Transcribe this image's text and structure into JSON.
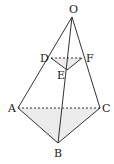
{
  "diagram": {
    "type": "geometry-pyramid",
    "points": {
      "O": {
        "label": "O",
        "x": 72,
        "y": 17
      },
      "D": {
        "label": "D",
        "x": 51,
        "y": 58
      },
      "E": {
        "label": "E",
        "x": 67,
        "y": 70
      },
      "F": {
        "label": "F",
        "x": 82,
        "y": 58
      },
      "A": {
        "label": "A",
        "x": 18,
        "y": 108
      },
      "B": {
        "label": "B",
        "x": 58,
        "y": 143
      },
      "C": {
        "label": "C",
        "x": 100,
        "y": 108
      }
    },
    "solid_edges": [
      "OA",
      "OB",
      "OC",
      "DE",
      "EF",
      "AB",
      "BC"
    ],
    "dashed_edges": [
      "DF",
      "AC"
    ],
    "shaded_faces": [
      "DEF",
      "ABC"
    ],
    "colors": {
      "line": "#333333",
      "shade": "#ececec"
    }
  }
}
